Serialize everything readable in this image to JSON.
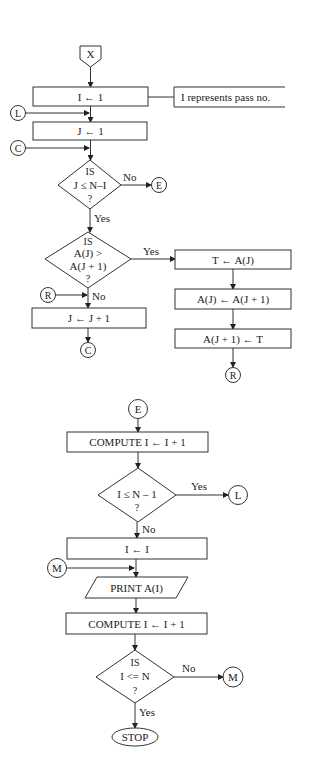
{
  "figure": {
    "header_fragment": "",
    "start_connector": {
      "label": "X"
    },
    "annotation": {
      "text": "I represents pass no."
    },
    "process_boxes": {
      "init_i": "I ← 1",
      "init_j": "J ← 1",
      "inc_j": "J ← J + 1",
      "swap_1": "T ← A(J)",
      "swap_2": "A(J) ← A(J + 1)",
      "swap_3": "A(J + 1) ← T",
      "compute_i_1": "COMPUTE I ← I + 1",
      "reset_i": "I ← I",
      "compute_i_2": "COMPUTE I ← I + 1"
    },
    "io_box": {
      "print": "PRINT A(I)"
    },
    "decisions": {
      "d1": {
        "line1": "IS",
        "line2": "J ≤ N–I",
        "line3": "?",
        "yes": "Yes",
        "no": "No"
      },
      "d2": {
        "line1": "IS",
        "line2": "A(J) >",
        "line3": "A(J + 1)",
        "line4": "?",
        "yes": "Yes",
        "no": "No"
      },
      "d3": {
        "line1": "I ≤ N – 1",
        "line2": "?",
        "yes": "Yes",
        "no": "No"
      },
      "d4": {
        "line1": "IS",
        "line2": "I <= N",
        "line3": "?",
        "yes": "Yes",
        "no": "No"
      }
    },
    "connectors": {
      "L": "L",
      "C": "C",
      "E": "E",
      "R": "R",
      "M": "M"
    },
    "terminal": {
      "stop": "STOP"
    }
  }
}
